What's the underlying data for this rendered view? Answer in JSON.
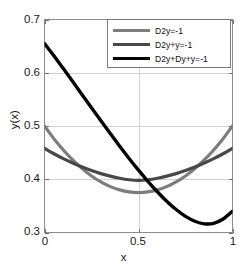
{
  "chart_data": {
    "type": "line",
    "title": "",
    "xlabel": "x",
    "ylabel": "y(x)",
    "xlim": [
      0,
      1
    ],
    "ylim": [
      0.3,
      0.7
    ],
    "xticks": [
      "0",
      "0.5",
      "1"
    ],
    "xtick_values": [
      0,
      0.5,
      1
    ],
    "yticks": [
      "0.3",
      "0.4",
      "0.5",
      "0.6",
      "0.7"
    ],
    "ytick_values": [
      0.3,
      0.4,
      0.5,
      0.6,
      0.7
    ],
    "grid": true,
    "legend_position": "top-right",
    "series": [
      {
        "name": "D2y=-1",
        "color": "#7d7d7d",
        "linewidth": 3.2,
        "x": [
          0,
          0.05,
          0.1,
          0.15,
          0.2,
          0.25,
          0.3,
          0.35,
          0.4,
          0.45,
          0.5,
          0.55,
          0.6,
          0.65,
          0.7,
          0.75,
          0.8,
          0.85,
          0.9,
          0.95,
          1
        ],
        "values": [
          0.5,
          0.4762,
          0.455,
          0.4362,
          0.42,
          0.4062,
          0.395,
          0.3862,
          0.38,
          0.3762,
          0.375,
          0.3762,
          0.38,
          0.3862,
          0.395,
          0.4062,
          0.42,
          0.4362,
          0.455,
          0.4762,
          0.5
        ]
      },
      {
        "name": "D2y+y=-1",
        "color": "#484848",
        "linewidth": 3.2,
        "x": [
          0,
          0.05,
          0.1,
          0.15,
          0.2,
          0.25,
          0.3,
          0.35,
          0.4,
          0.45,
          0.5,
          0.55,
          0.6,
          0.65,
          0.7,
          0.75,
          0.8,
          0.85,
          0.9,
          0.95,
          1
        ],
        "values": [
          0.458,
          0.4479,
          0.4387,
          0.4304,
          0.4229,
          0.4163,
          0.4106,
          0.4058,
          0.4019,
          0.3991,
          0.3978,
          0.3991,
          0.4019,
          0.4058,
          0.4106,
          0.4163,
          0.4229,
          0.4304,
          0.4387,
          0.4479,
          0.458
        ]
      },
      {
        "name": "D2y+Dy+y=-1",
        "color": "#000000",
        "linewidth": 3.4,
        "x": [
          0,
          0.05,
          0.1,
          0.15,
          0.2,
          0.25,
          0.3,
          0.35,
          0.4,
          0.45,
          0.5,
          0.55,
          0.6,
          0.65,
          0.7,
          0.75,
          0.8,
          0.85,
          0.9,
          0.95,
          1
        ],
        "values": [
          0.655,
          0.6318,
          0.6078,
          0.5835,
          0.5589,
          0.5343,
          0.5098,
          0.4857,
          0.462,
          0.4391,
          0.417,
          0.3961,
          0.3766,
          0.3588,
          0.3431,
          0.3303,
          0.3211,
          0.3163,
          0.3173,
          0.3254,
          0.34
        ]
      }
    ]
  },
  "legend": {
    "entries": [
      {
        "label": "D2y=-1"
      },
      {
        "label": "D2y+y=-1"
      },
      {
        "label": "D2y+Dy+y=-1"
      }
    ]
  },
  "axes": {
    "x_title": "x",
    "y_title": "y(x)",
    "x_tick_labels": [
      "0",
      "0.5",
      "1"
    ],
    "y_tick_labels": [
      "0.7",
      "0.6",
      "0.5",
      "0.4",
      "0.3"
    ]
  },
  "colors": {
    "background": "#ffffff",
    "axis": "#8d8d8d",
    "grid": "#d2d2d2",
    "text": "#1a1a1a",
    "series_1": "#7d7d7d",
    "series_2": "#484848",
    "series_3": "#000000"
  }
}
